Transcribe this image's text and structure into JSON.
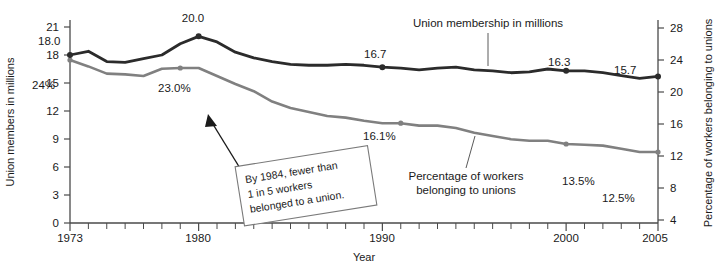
{
  "chart_data": {
    "type": "line",
    "title": "",
    "xlabel": "Year",
    "ylabel": "Union members in millions",
    "y2label": "Percentage of workers belonging to unions",
    "xlim": [
      1973,
      2005
    ],
    "ylim": [
      0,
      21
    ],
    "y2lim": [
      0,
      28
    ],
    "grid": false,
    "legend_position": "inline-annotations",
    "x_tick_labels": [
      "1973",
      "1980",
      "1990",
      "2000",
      "2005"
    ],
    "x_tick_values": [
      1973,
      1980,
      1990,
      2000,
      2005
    ],
    "y_tick_labels": [
      "0",
      "3",
      "6",
      "9",
      "12",
      "15",
      "18",
      "21"
    ],
    "y_tick_values": [
      0,
      3,
      6,
      9,
      12,
      15,
      18,
      21
    ],
    "y2_tick_labels": [
      "4",
      "8",
      "12",
      "16",
      "20",
      "24",
      "28"
    ],
    "y2_tick_values": [
      4,
      8,
      12,
      16,
      20,
      24,
      28
    ],
    "x": [
      1973,
      1974,
      1975,
      1976,
      1977,
      1978,
      1979,
      1980,
      1981,
      1982,
      1983,
      1984,
      1985,
      1986,
      1987,
      1988,
      1989,
      1990,
      1991,
      1992,
      1993,
      1994,
      1995,
      1996,
      1997,
      1998,
      1999,
      2000,
      2001,
      2002,
      2003,
      2004,
      2005
    ],
    "series": [
      {
        "name": "Union membership in millions",
        "axis": "left",
        "color": "#2b2b2b",
        "values": [
          18.0,
          18.4,
          17.3,
          17.2,
          17.6,
          18.0,
          19.2,
          20.0,
          19.4,
          18.3,
          17.7,
          17.3,
          17.0,
          16.9,
          16.9,
          17.0,
          16.9,
          16.7,
          16.6,
          16.4,
          16.6,
          16.7,
          16.4,
          16.3,
          16.1,
          16.2,
          16.5,
          16.3,
          16.3,
          16.1,
          15.8,
          15.5,
          15.7
        ],
        "marked_points": [
          {
            "x": 1973,
            "y": 18.0,
            "label": "18.0"
          },
          {
            "x": 1980,
            "y": 20.0,
            "label": "20.0"
          },
          {
            "x": 1990,
            "y": 16.7,
            "label": "16.7"
          },
          {
            "x": 2000,
            "y": 16.3,
            "label": "16.3"
          },
          {
            "x": 2005,
            "y": 15.7,
            "label": "15.7"
          }
        ]
      },
      {
        "name": "Percentage of workers belonging to unions",
        "axis": "right",
        "color": "#808080",
        "values": [
          24.0,
          23.2,
          22.3,
          22.2,
          22.0,
          22.9,
          23.0,
          23.0,
          22.0,
          21.0,
          20.1,
          18.8,
          18.0,
          17.5,
          17.0,
          16.8,
          16.4,
          16.1,
          16.1,
          15.8,
          15.8,
          15.5,
          14.9,
          14.5,
          14.1,
          13.9,
          13.9,
          13.5,
          13.4,
          13.3,
          12.9,
          12.5,
          12.5
        ],
        "marked_points": [
          {
            "x": 1973,
            "y": 24.0,
            "label": "24%"
          },
          {
            "x": 1979,
            "y": 23.0,
            "label": "23.0%"
          },
          {
            "x": 1991,
            "y": 16.1,
            "label": "16.1%"
          },
          {
            "x": 2000,
            "y": 13.5,
            "label": "13.5%"
          },
          {
            "x": 2005,
            "y": 12.5,
            "label": "12.5%"
          }
        ]
      }
    ],
    "annotations": [
      {
        "name": "callout-box",
        "lines": [
          "By 1984, fewer than",
          "1 in 5 workers",
          "belonged to a union."
        ],
        "points_to": "gray line near 1984"
      },
      {
        "name": "series-callout-dark",
        "text": "Union membership in millions"
      },
      {
        "name": "series-callout-gray",
        "text": "Percentage of workers",
        "text2": "belonging to unions"
      }
    ]
  }
}
